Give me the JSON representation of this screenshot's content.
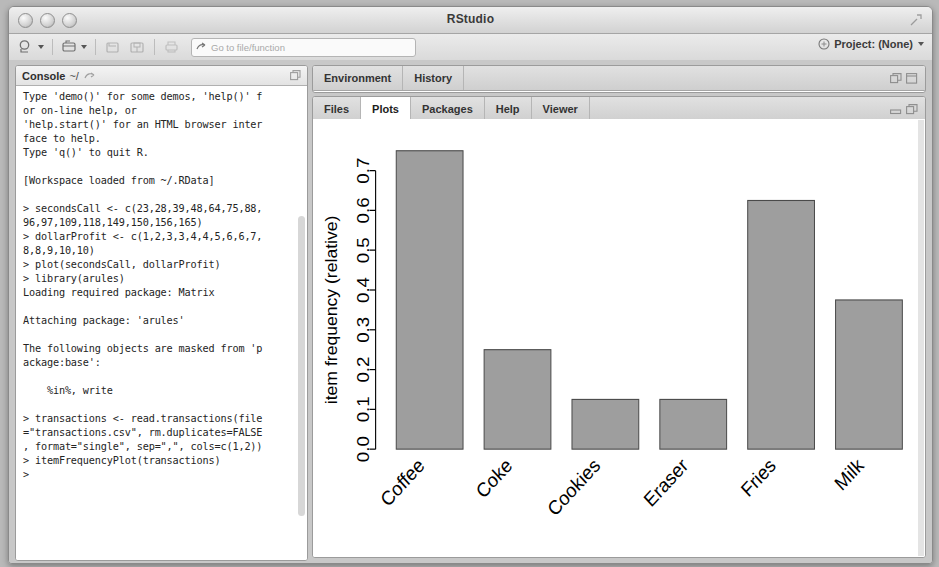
{
  "window": {
    "title": "RStudio",
    "lights": [
      "close",
      "minimize",
      "zoom"
    ],
    "expand_icon": "expand-icon"
  },
  "toolbar": {
    "new_file_icon": "new-file-icon",
    "new_project_icon": "new-project-icon",
    "open_icon": "open-file-icon",
    "save_icon": "save-icon",
    "save_all_icon": "save-all-icon",
    "print_icon": "print-icon",
    "goto_placeholder": "Go to file/function",
    "goto_value": "",
    "goto_icon": "goto-arrow-icon",
    "project_label": "Project: (None)",
    "project_icon": "project-icon"
  },
  "console": {
    "title": "Console",
    "path": "~/",
    "minimize_icon": "maximize-pane-icon",
    "text": "Type 'demo()' for some demos, 'help()' f\nor on-line help, or\n'help.start()' for an HTML browser inter\nface to help.\nType 'q()' to quit R.\n\n[Workspace loaded from ~/.RData]\n\n> secondsCall <- c(23,28,39,48,64,75,88,\n96,97,109,118,149,150,156,165)\n> dollarProfit <- c(1,2,3,3,4,4,5,6,6,7,\n8,8,9,10,10)\n> plot(secondsCall, dollarProfit)\n> library(arules)\nLoading required package: Matrix\n\nAttaching package: 'arules'\n\nThe following objects are masked from 'p\nackage:base':\n\n    %in%, write\n\n> transactions <- read.transactions(file\n=\"transactions.csv\", rm.duplicates=FALSE\n, format=\"single\", sep=\",\", cols=c(1,2))\n> itemFrequencyPlot(transactions)\n> "
  },
  "environment_pane": {
    "tabs": [
      {
        "label": "Environment",
        "active": false
      },
      {
        "label": "History",
        "active": false
      }
    ],
    "minimize_icon": "minimize-pane-icon",
    "maximize_icon": "maximize-pane-icon"
  },
  "plots_pane": {
    "tabs": [
      {
        "label": "Files",
        "active": false
      },
      {
        "label": "Plots",
        "active": true
      },
      {
        "label": "Packages",
        "active": false
      },
      {
        "label": "Help",
        "active": false
      },
      {
        "label": "Viewer",
        "active": false
      }
    ],
    "minimize_icon": "minimize-pane-icon",
    "maximize_icon": "maximize-pane-icon",
    "toolbar": {
      "back_icon": "back-arrow-icon",
      "forward_icon": "forward-arrow-icon",
      "zoom_label": "Zoom",
      "zoom_icon": "magnifier-icon",
      "export_label": "Export",
      "export_icon": "export-icon",
      "remove_icon": "remove-plot-icon",
      "clear_all_label": "Clear All",
      "clear_all_icon": "broom-icon",
      "refresh_icon": "refresh-icon"
    }
  },
  "chart_data": {
    "type": "bar",
    "title": "",
    "xlabel": "",
    "ylabel": "item frequency (relative)",
    "categories": [
      "Coffee",
      "Coke",
      "Cookies",
      "Eraser",
      "Fries",
      "Milk"
    ],
    "values": [
      0.75,
      0.25,
      0.125,
      0.125,
      0.625,
      0.375
    ],
    "ylim": [
      0.0,
      0.78
    ],
    "yticks": [
      0.0,
      0.1,
      0.2,
      0.3,
      0.4,
      0.5,
      0.6,
      0.7
    ],
    "ytick_labels": [
      "0.0",
      "0.1",
      "0.2",
      "0.3",
      "0.4",
      "0.5",
      "0.6",
      "0.7"
    ],
    "grid": false,
    "legend": "none",
    "bar_fill": "#9e9e9e",
    "bar_stroke": "#4a4a4a",
    "axis_color": "#000000",
    "label_rotation": -45
  }
}
